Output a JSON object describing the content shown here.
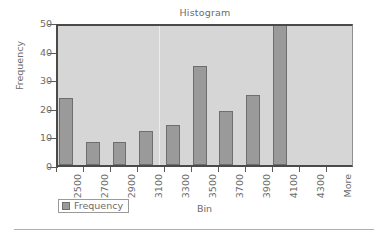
{
  "chart_data": {
    "type": "bar",
    "title": "Histogram",
    "xlabel": "Bin",
    "ylabel": "Frequency",
    "categories": [
      "2500",
      "2700",
      "2900",
      "3100",
      "3300",
      "3500",
      "3700",
      "3900",
      "4100",
      "4300",
      "More"
    ],
    "values": [
      23.5,
      8,
      8,
      12,
      14,
      34.5,
      19,
      24.5,
      50,
      0,
      0
    ],
    "series": [
      {
        "name": "Frequency",
        "values": [
          23.5,
          8,
          8,
          12,
          14,
          34.5,
          19,
          24.5,
          50,
          0,
          0
        ]
      }
    ],
    "ylim": [
      0,
      50
    ],
    "yticks": [
      0,
      10,
      20,
      30,
      40,
      50
    ],
    "ytick_labels": [
      "0",
      "10",
      "20",
      "30",
      "40",
      "50"
    ],
    "grid": false,
    "legend": {
      "position": "bottom-left",
      "entries": [
        "Frequency"
      ]
    }
  },
  "legend": {
    "label": "Frequency"
  },
  "colors": {
    "bar_fill": "#9a9a9a",
    "bar_border": "#6e6e6e",
    "plot_background": "#d6d6d6",
    "axis": "#4a4a4a",
    "text": "#6b6b6b",
    "page_background": "#ffffff"
  }
}
